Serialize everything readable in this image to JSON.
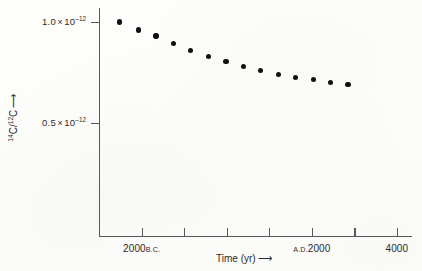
{
  "chart_data": {
    "type": "scatter",
    "title": "",
    "xlabel": "Time (yr)",
    "ylabel": "14C/12C",
    "ylabel_parts": {
      "numerator_sup": "14",
      "numerator_base": "C",
      "separator": "/",
      "denominator_sup": "12",
      "denominator_base": "C",
      "arrow": "⟶"
    },
    "xlabel_arrow": "⟶",
    "grid": false,
    "legend": null,
    "xlim": [
      -3000,
      4000
    ],
    "ylim": [
      1.8e-13,
      1.07e-12
    ],
    "y_tick_values": [
      1e-12,
      5e-13
    ],
    "y_tick_labels": [
      {
        "mantissa": "1.0",
        "times": "×",
        "base": "10",
        "exponent": "‒12"
      },
      {
        "mantissa": "0.5",
        "times": "×",
        "base": "10",
        "exponent": "‒12"
      }
    ],
    "x_tick_values": [
      -3000,
      -2000,
      -1000,
      0,
      1000,
      2000,
      3000,
      4000
    ],
    "x_tick_labels": [
      {
        "value": -3000,
        "number": "",
        "era": "",
        "shown": false
      },
      {
        "value": -2000,
        "number": "2000",
        "era": "B.C.",
        "shown": true
      },
      {
        "value": -1000,
        "number": "",
        "era": "",
        "shown": false
      },
      {
        "value": 0,
        "number": "",
        "era": "",
        "shown": false
      },
      {
        "value": 1000,
        "number": "",
        "era": "",
        "shown": false
      },
      {
        "value": 2000,
        "number": "2000",
        "era": "A.D.",
        "era_leading": true,
        "shown": true
      },
      {
        "value": 3000,
        "number": "",
        "era": "",
        "shown": false
      },
      {
        "value": 4000,
        "number": "4000",
        "era": "",
        "shown": true
      }
    ],
    "series": [
      {
        "name": "14C/12C ratio",
        "marker": "filled-circle",
        "color": "#101010",
        "points": [
          {
            "x": -2515,
            "y": 1e-12
          },
          {
            "x": -2075,
            "y": 9.6e-13
          },
          {
            "x": -1660,
            "y": 9.3e-13
          },
          {
            "x": -1250,
            "y": 8.95e-13
          },
          {
            "x": -850,
            "y": 8.6e-13
          },
          {
            "x": -425,
            "y": 8.3e-13
          },
          {
            "x": -20,
            "y": 8.05e-13
          },
          {
            "x": 395,
            "y": 7.8e-13
          },
          {
            "x": 800,
            "y": 7.6e-13
          },
          {
            "x": 1215,
            "y": 7.4e-13
          },
          {
            "x": 1615,
            "y": 7.25e-13
          },
          {
            "x": 2040,
            "y": 7.15e-13
          },
          {
            "x": 2440,
            "y": 7e-13
          },
          {
            "x": 2845,
            "y": 6.9e-13
          }
        ]
      }
    ]
  },
  "colors": {
    "marker": "#101010",
    "axis": "#58585a",
    "text": "#2b2b2d",
    "background": "#fdfdfb"
  }
}
